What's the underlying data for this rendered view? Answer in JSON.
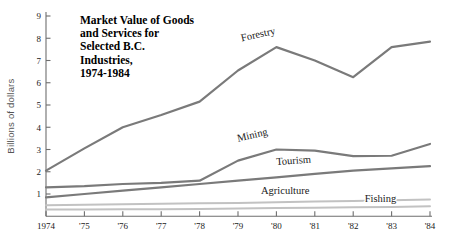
{
  "chart_data": {
    "type": "line",
    "title_lines": [
      "Market Value of Goods",
      "and Services for",
      "Selected B.C.",
      "Industries,",
      "1974-1984"
    ],
    "xlabel": "",
    "ylabel": "Billions of dollars",
    "x": [
      "1974",
      "'75",
      "'76",
      "'77",
      "'78",
      "'79",
      "'80",
      "'81",
      "'82",
      "'83",
      "'84"
    ],
    "x_values": [
      1974,
      1975,
      1976,
      1977,
      1978,
      1979,
      1980,
      1981,
      1982,
      1983,
      1984
    ],
    "ylim": [
      0,
      9
    ],
    "xlim": [
      1974,
      1984
    ],
    "yticks": [
      1,
      2,
      3,
      4,
      5,
      6,
      7,
      8,
      9
    ],
    "ytick_labels": [
      "1",
      "2",
      "3",
      "4",
      "5",
      "6",
      "7",
      "8",
      "9"
    ],
    "grid": false,
    "legend_position": "inline-labels",
    "series": [
      {
        "name": "Forestry",
        "color": "#7a7a7a",
        "width": 2.2,
        "values": [
          2.05,
          3.05,
          4.0,
          4.55,
          5.15,
          6.55,
          7.6,
          7.0,
          6.25,
          7.6,
          7.85
        ],
        "label_x": 1979.1,
        "label_y": 7.85,
        "label_rotation": -13
      },
      {
        "name": "Mining",
        "color": "#7a7a7a",
        "width": 2.2,
        "values": [
          1.3,
          1.35,
          1.45,
          1.5,
          1.6,
          2.5,
          3.0,
          2.95,
          2.7,
          2.72,
          3.25
        ],
        "label_x": 1979.0,
        "label_y": 3.35,
        "label_rotation": -13
      },
      {
        "name": "Tourism",
        "color": "#7a7a7a",
        "width": 2.2,
        "values": [
          0.85,
          1.0,
          1.15,
          1.3,
          1.45,
          1.6,
          1.75,
          1.9,
          2.05,
          2.15,
          2.25
        ],
        "label_x": 1980.0,
        "label_y": 2.3,
        "label_rotation": -4
      },
      {
        "name": "Agriculture",
        "color": "#c2c2c2",
        "width": 2.0,
        "values": [
          0.5,
          0.52,
          0.54,
          0.56,
          0.58,
          0.6,
          0.63,
          0.66,
          0.68,
          0.72,
          0.75
        ],
        "label_x": 1979.6,
        "label_y": 1.0,
        "label_rotation": 0
      },
      {
        "name": "Fishing",
        "color": "#c2c2c2",
        "width": 2.0,
        "values": [
          0.3,
          0.3,
          0.31,
          0.32,
          0.33,
          0.35,
          0.37,
          0.38,
          0.4,
          0.42,
          0.45
        ],
        "label_x": 1982.3,
        "label_y": 0.62,
        "label_rotation": 0
      }
    ]
  }
}
